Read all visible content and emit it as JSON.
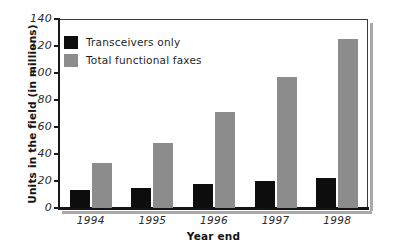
{
  "chart_data": {
    "type": "bar",
    "title": "",
    "xlabel": "Year end",
    "ylabel": "Units in the field (in millions)",
    "categories": [
      "1994",
      "1995",
      "1996",
      "1997",
      "1998"
    ],
    "series": [
      {
        "name": "Transceivers only",
        "color": "#0d0d0d",
        "values": [
          13,
          15,
          18,
          20,
          22
        ]
      },
      {
        "name": "Total functional faxes",
        "color": "#8c8c8c",
        "values": [
          33,
          48,
          71,
          97,
          125
        ]
      }
    ],
    "ylim": [
      0,
      140
    ],
    "yticks": [
      0,
      20,
      40,
      60,
      80,
      100,
      120,
      140
    ],
    "ytick_labels": [
      "0",
      "20",
      "40",
      "60",
      "80",
      "100",
      "120",
      "140"
    ],
    "grid": false,
    "legend_position": "top-left"
  },
  "legend": {
    "items": [
      {
        "label": "Transceivers only",
        "swatch": "black-swatch-icon"
      },
      {
        "label": "Total functional faxes",
        "swatch": "gray-swatch-icon"
      }
    ]
  }
}
